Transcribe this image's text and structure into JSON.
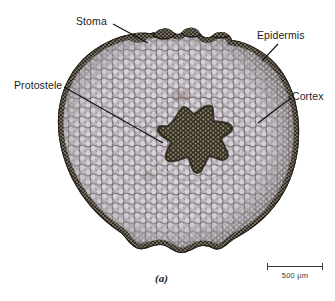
{
  "figure": {
    "panel_letter": "(a)",
    "background_color": "#ffffff"
  },
  "annotations": [
    {
      "id": "stoma",
      "label": "Stoma",
      "leader": {
        "x1": 113,
        "y1": 24,
        "x2": 148,
        "y2": 43
      }
    },
    {
      "id": "epidermis",
      "label": "Epidermis",
      "leader": {
        "x1": 278,
        "y1": 44,
        "x2": 262,
        "y2": 61
      }
    },
    {
      "id": "protostele",
      "label": "Protostele",
      "leader": {
        "x1": 64,
        "y1": 87,
        "x2": 163,
        "y2": 143
      }
    },
    {
      "id": "cortex",
      "label": "Cortex",
      "leader": {
        "x1": 291,
        "y1": 98,
        "x2": 258,
        "y2": 123
      }
    }
  ],
  "scale_bar": {
    "length_label": "500 μm",
    "value": 500,
    "unit": "μm",
    "pixel_length": 56,
    "color": "#3a3a3a"
  },
  "micrograph": {
    "tissues": [
      {
        "name": "epidermis",
        "description": "dark outer cell layer",
        "color": "#2b241c"
      },
      {
        "name": "cortex",
        "description": "large pale rounded cells",
        "color": "#cfc9d2"
      },
      {
        "name": "protostele",
        "description": "dark star-shaped core",
        "color": "#3a3226"
      },
      {
        "name": "stoma",
        "description": "raised dark bump on surface",
        "color": "#241f18"
      }
    ],
    "stain_tone": "#b9b2bd"
  }
}
